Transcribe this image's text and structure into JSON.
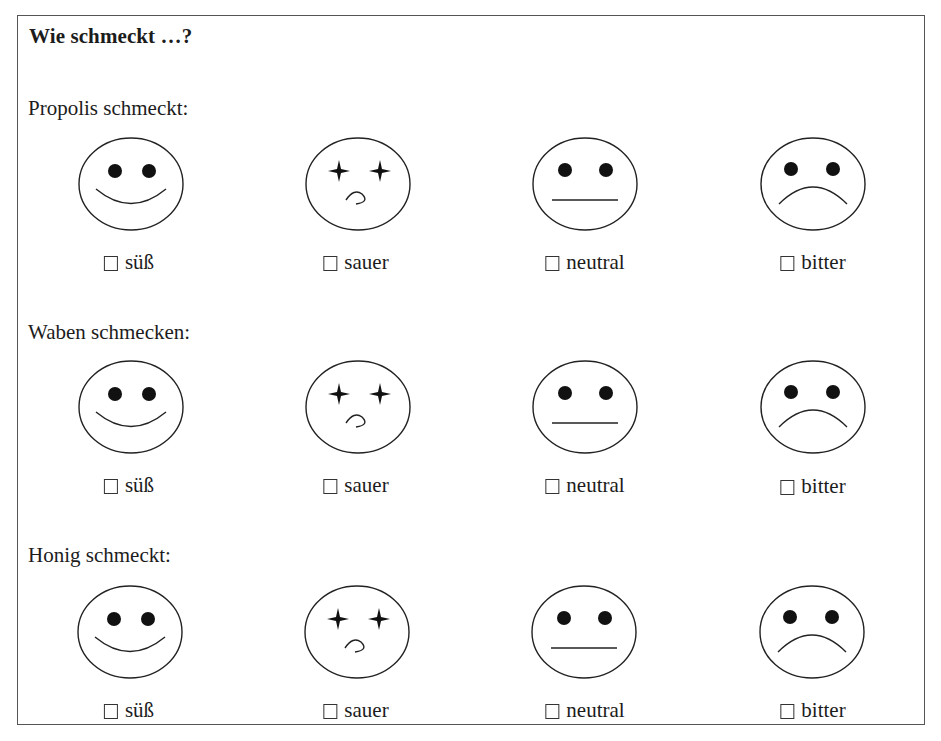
{
  "title": "Wie schmeckt …?",
  "sections": [
    {
      "label": "Propolis schmeckt:",
      "options": [
        {
          "face": "happy-face",
          "label": "süß",
          "checked": false
        },
        {
          "face": "sour-face",
          "label": "sauer",
          "checked": false
        },
        {
          "face": "neutral-face",
          "label": "neutral",
          "checked": false
        },
        {
          "face": "sad-face",
          "label": "bitter",
          "checked": false
        }
      ]
    },
    {
      "label": "Waben schmecken:",
      "options": [
        {
          "face": "happy-face",
          "label": "süß",
          "checked": false
        },
        {
          "face": "sour-face",
          "label": "sauer",
          "checked": false
        },
        {
          "face": "neutral-face",
          "label": "neutral",
          "checked": false
        },
        {
          "face": "sad-face",
          "label": "bitter",
          "checked": false
        }
      ]
    },
    {
      "label": "Honig schmeckt:",
      "options": [
        {
          "face": "happy-face",
          "label": "süß",
          "checked": false
        },
        {
          "face": "sour-face",
          "label": "sauer",
          "checked": false
        },
        {
          "face": "neutral-face",
          "label": "neutral",
          "checked": false
        },
        {
          "face": "sad-face",
          "label": "bitter",
          "checked": false
        }
      ]
    }
  ]
}
